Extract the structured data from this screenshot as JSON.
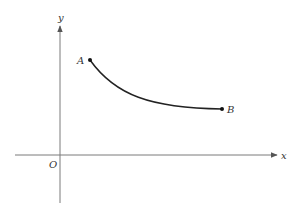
{
  "diagram": {
    "axes": {
      "x_label": "x",
      "y_label": "y",
      "origin_label": "O",
      "axis_color": "#7a7a7a"
    },
    "curve": {
      "color": "#222222",
      "start_point": {
        "label": "A"
      },
      "end_point": {
        "label": "B"
      }
    }
  }
}
